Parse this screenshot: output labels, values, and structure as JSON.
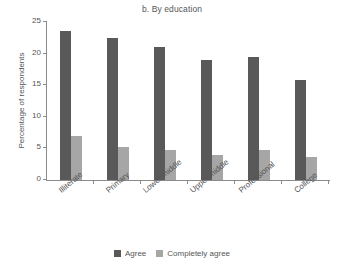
{
  "chart_data": {
    "type": "bar",
    "title": "b. By education",
    "xlabel": "",
    "ylabel": "Percentage of respondents",
    "ylim": [
      0,
      25
    ],
    "yticks": [
      0,
      5,
      10,
      15,
      20,
      25
    ],
    "ytick_labels": [
      "0",
      "5",
      "10",
      "15",
      "20",
      "25"
    ],
    "grid": false,
    "legend_position": "bottom",
    "categories": [
      "Illiterate",
      "Primary",
      "Lower middle",
      "Upper middle",
      "Professional",
      "College"
    ],
    "series": [
      {
        "name": "Agree",
        "color": "#595959",
        "values": [
          23.6,
          22.5,
          21.0,
          19.0,
          19.4,
          15.8
        ]
      },
      {
        "name": "Completely agree",
        "color": "#a6a6a6",
        "values": [
          6.9,
          5.2,
          4.8,
          3.9,
          4.8,
          3.7
        ]
      }
    ]
  }
}
